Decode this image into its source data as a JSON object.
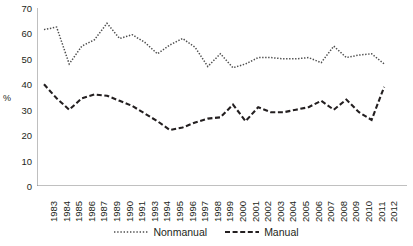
{
  "chart_data": {
    "type": "line",
    "title": "",
    "xlabel": "",
    "ylabel": "%",
    "ylim": [
      0,
      70
    ],
    "ytick_step": 10,
    "yticks": [
      70,
      60,
      50,
      40,
      30,
      20,
      10,
      0
    ],
    "grid": false,
    "legend_position": "bottom-center",
    "categories": [
      "1983",
      "1984",
      "1985",
      "1986",
      "1987",
      "1989",
      "1990",
      "1991",
      "1993",
      "1994",
      "1995",
      "1996",
      "1997",
      "1998",
      "1999",
      "2000",
      "2001",
      "2002",
      "2003",
      "2004",
      "2005",
      "2006",
      "2007",
      "2008",
      "2009",
      "2010",
      "2011",
      "2012"
    ],
    "series": [
      {
        "name": "Nonmanual",
        "style": "dotted",
        "color": "#4d4d4d",
        "values": [
          61.5,
          62.5,
          48.0,
          55.0,
          57.5,
          64.0,
          58.0,
          59.5,
          56.5,
          52.0,
          55.5,
          58.0,
          54.5,
          47.0,
          52.0,
          46.5,
          48.0,
          50.5,
          50.5,
          50.0,
          50.0,
          50.5,
          48.5,
          55.0,
          50.5,
          51.5,
          52.0,
          48.0
        ]
      },
      {
        "name": "Manual",
        "style": "dashed",
        "color": "#231f20",
        "values": [
          40.0,
          34.5,
          30.0,
          34.5,
          36.0,
          35.5,
          33.5,
          31.5,
          28.5,
          25.5,
          22.0,
          23.0,
          25.0,
          26.5,
          27.0,
          32.0,
          25.5,
          31.0,
          29.0,
          29.0,
          30.0,
          31.0,
          33.5,
          30.0,
          34.0,
          29.0,
          26.0,
          39.0
        ]
      }
    ]
  },
  "legend": {
    "items": [
      {
        "label": "Nonmanual",
        "style": "dotted"
      },
      {
        "label": "Manual",
        "style": "dashed"
      }
    ]
  },
  "colors": {
    "nonmanual": "#4d4d4d",
    "manual": "#231f20",
    "axis": "#808080",
    "text": "#231f20"
  }
}
